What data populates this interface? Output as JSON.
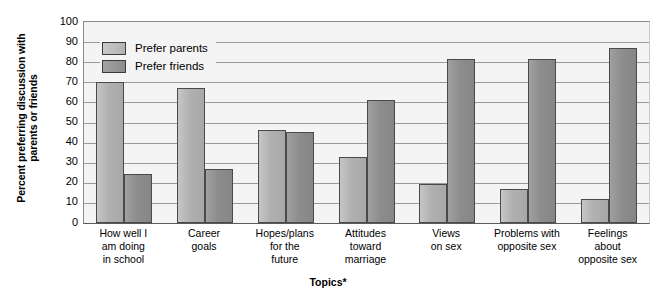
{
  "chart_data": {
    "type": "bar",
    "title": "",
    "xlabel": "Topics*",
    "ylabel": "Percent preferring discussion with\nparents or friends",
    "ylim": [
      0,
      100
    ],
    "yticks": [
      0,
      10,
      20,
      30,
      40,
      50,
      60,
      70,
      80,
      90,
      100
    ],
    "grid": true,
    "legend_position": "top-left",
    "categories": [
      "How well I\nam doing\nin school",
      "Career\ngoals",
      "Hopes/plans\nfor the\nfuture",
      "Attitudes\ntoward\nmarriage",
      "Views\non sex",
      "Problems with\nopposite sex",
      "Feelings\nabout\nopposite sex"
    ],
    "series": [
      {
        "name": "Prefer parents",
        "color": "#b5b5b5",
        "values": [
          70,
          67,
          46.5,
          33,
          19.5,
          17,
          12
        ]
      },
      {
        "name": "Prefer friends",
        "color": "#8d8d8d",
        "values": [
          24.5,
          27,
          45.5,
          61,
          81.5,
          81.5,
          87
        ]
      }
    ]
  },
  "axis": {
    "y_title": "Percent preferring discussion with\nparents or friends",
    "x_title": "Topics*"
  },
  "legend": {
    "items": [
      {
        "label": "Prefer parents"
      },
      {
        "label": "Prefer friends"
      }
    ]
  }
}
